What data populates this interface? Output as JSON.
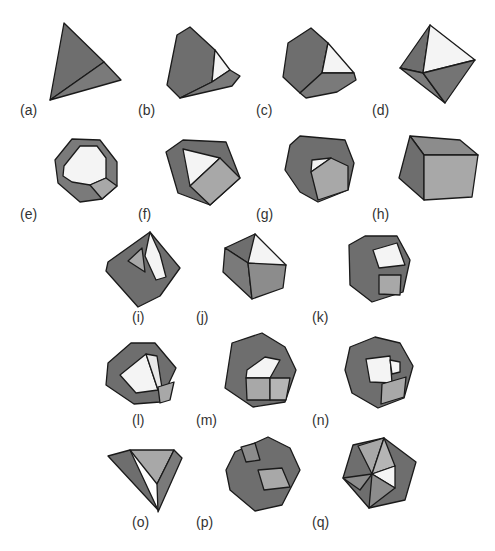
{
  "figure": {
    "colors": {
      "dark_face": "#6e6e6e",
      "mid_face": "#8c8c8c",
      "light_face": "#a8a8a8",
      "white_face": "#f4f4f4",
      "edge": "#1a1a1a"
    },
    "panels": [
      {
        "id": "a",
        "label": "(a)",
        "lx": 20,
        "ly": 103
      },
      {
        "id": "b",
        "label": "(b)",
        "lx": 138,
        "ly": 103
      },
      {
        "id": "c",
        "label": "(c)",
        "lx": 256,
        "ly": 103
      },
      {
        "id": "d",
        "label": "(d)",
        "lx": 372,
        "ly": 103
      },
      {
        "id": "e",
        "label": "(e)",
        "lx": 20,
        "ly": 207
      },
      {
        "id": "f",
        "label": "(f)",
        "lx": 138,
        "ly": 207
      },
      {
        "id": "g",
        "label": "(g)",
        "lx": 256,
        "ly": 207
      },
      {
        "id": "h",
        "label": "(h)",
        "lx": 372,
        "ly": 207
      },
      {
        "id": "i",
        "label": "(i)",
        "lx": 132,
        "ly": 310
      },
      {
        "id": "j",
        "label": "(j)",
        "lx": 196,
        "ly": 310
      },
      {
        "id": "k",
        "label": "(k)",
        "lx": 312,
        "ly": 310
      },
      {
        "id": "l",
        "label": "(l)",
        "lx": 132,
        "ly": 413
      },
      {
        "id": "m",
        "label": "(m)",
        "lx": 196,
        "ly": 413
      },
      {
        "id": "n",
        "label": "(n)",
        "lx": 312,
        "ly": 413
      },
      {
        "id": "o",
        "label": "(o)",
        "lx": 132,
        "ly": 515
      },
      {
        "id": "p",
        "label": "(p)",
        "lx": 196,
        "ly": 515
      },
      {
        "id": "q",
        "label": "(q)",
        "lx": 312,
        "ly": 515
      }
    ]
  }
}
